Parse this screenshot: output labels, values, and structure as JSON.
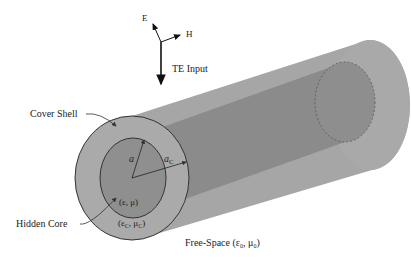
{
  "diagram": {
    "labels": {
      "e_field": "E",
      "h_field": "H",
      "input": "TE Input",
      "cover_shell": "Cover Shell",
      "hidden_core": "Hidden Core",
      "radius_core": "a",
      "radius_cover": "a",
      "radius_cover_sub": "C",
      "core_params": "(ε, μ)",
      "shell_params_eps": "(ε",
      "shell_params_sub1": "C",
      "shell_params_mid": ", μ",
      "shell_params_sub2": "C",
      "shell_params_end": ")",
      "free_space_prefix": "Free-Space (ε",
      "free_space_sub1": "0",
      "free_space_mid": ", μ",
      "free_space_sub2": "0",
      "free_space_end": ")"
    },
    "colors": {
      "shell": "#a9a9a9",
      "core": "#8e8e8e",
      "shell_side": "#9a9a9a",
      "core_side": "#858585",
      "outline": "#333333",
      "arrow": "#111111"
    }
  }
}
